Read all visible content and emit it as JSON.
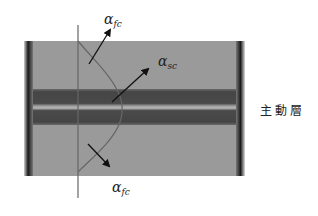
{
  "diagram": {
    "title": "",
    "labels": {
      "top_arrow": {
        "symbol": "α",
        "subscript": "fc"
      },
      "middle_arrow": {
        "symbol": "α",
        "subscript": "sc"
      },
      "bottom_arrow": {
        "symbol": "α",
        "subscript": "fc"
      },
      "active_layer": "主動層"
    },
    "colors": {
      "background": "#ffffff",
      "cladding": "#9a9a9a",
      "active_dark": "#4a4a4a",
      "active_center": "#b0b0b0",
      "side_bars": "#1a1a1a",
      "lines": "#555555",
      "arrows": "#111111"
    }
  }
}
